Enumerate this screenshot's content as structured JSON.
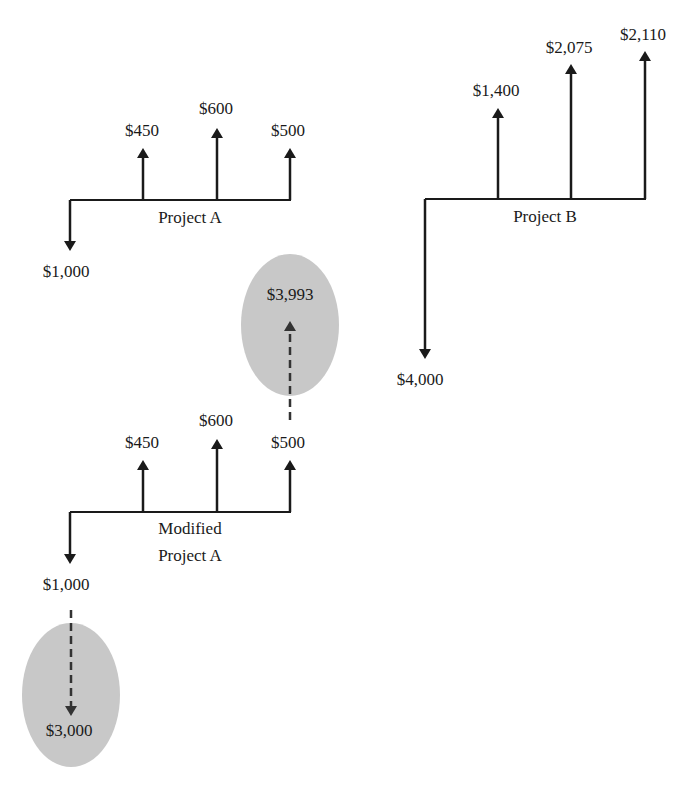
{
  "colors": {
    "line": "#1a1a1a",
    "ellipse_fill": "#c8c8c8",
    "background": "#ffffff"
  },
  "project_a": {
    "title": "Project A",
    "outflow": "$1,000",
    "inflows": [
      "$450",
      "$600",
      "$500"
    ]
  },
  "project_b": {
    "title": "Project B",
    "outflow": "$4,000",
    "inflows": [
      "$1,400",
      "$2,075",
      "$2,110"
    ]
  },
  "modified_project_a": {
    "title_line1": "Modified",
    "title_line2": "Project A",
    "outflow": "$1,000",
    "inflows": [
      "$450",
      "$600",
      "$500"
    ],
    "terminal_value": "$3,993",
    "pv_outflow": "$3,000"
  }
}
